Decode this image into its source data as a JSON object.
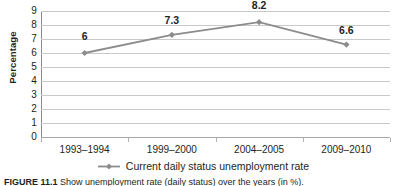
{
  "chart_data": {
    "type": "line",
    "title": "",
    "xlabel": "",
    "ylabel": "Percentage",
    "categories": [
      "1993–1994",
      "1999–2000",
      "2004–2005",
      "2009–2010"
    ],
    "series": [
      {
        "name": "Current daily status unemployment rate",
        "values": [
          6,
          7.3,
          8.2,
          6.6
        ],
        "point_labels": [
          "6",
          "7.3",
          "8.2",
          "6.6"
        ],
        "color": "#8c8c8c",
        "marker": "diamond"
      }
    ],
    "ylim": [
      0,
      9
    ],
    "y_ticks": [
      "0",
      "1",
      "2",
      "3",
      "4",
      "5",
      "6",
      "7",
      "8",
      "9"
    ],
    "grid": "horizontal",
    "legend_position": "bottom-center"
  },
  "legend": {
    "entries": [
      {
        "label": "Current daily status unemployment rate",
        "color": "#8c8c8c"
      }
    ]
  },
  "caption": {
    "prefix": "FIGURE 11.1",
    "text": "  Show unemployment rate (daily status) over the years (in %)."
  },
  "colors": {
    "series": "#8c8c8c",
    "gridline": "#c9c9c9",
    "axis": "#8a8a8a",
    "text": "#231f20"
  }
}
